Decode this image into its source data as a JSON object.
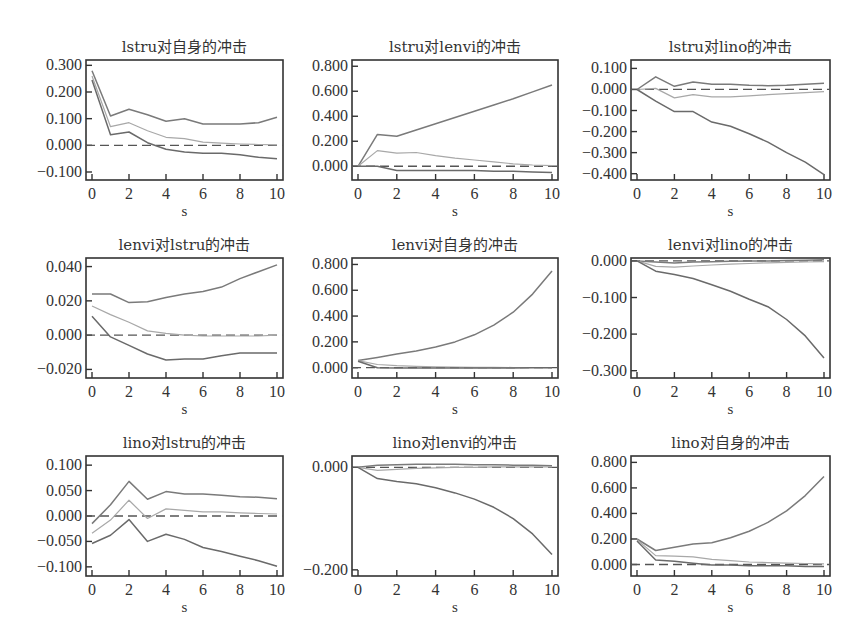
{
  "chart_data": [
    {
      "type": "line",
      "title": "lstru对自身的冲击",
      "xlabel": "s",
      "ylabel": "",
      "x": [
        0,
        1,
        2,
        3,
        4,
        5,
        6,
        7,
        8,
        9,
        10
      ],
      "xticks": [
        0,
        2,
        4,
        6,
        8,
        10
      ],
      "yticks": [
        -0.1,
        0,
        0.1,
        0.2,
        0.3
      ],
      "ytick_labels": [
        "−0.100",
        "0.000",
        "0.100",
        "0.200",
        "0.300"
      ],
      "ylim": [
        -0.13,
        0.32
      ],
      "frame": {
        "x": 86,
        "y": 60,
        "w": 197,
        "h": 120
      },
      "series": [
        {
          "name": "upper",
          "values": [
            0.28,
            0.11,
            0.135,
            0.115,
            0.09,
            0.1,
            0.08,
            0.08,
            0.08,
            0.085,
            0.105
          ]
        },
        {
          "name": "irf",
          "values": [
            0.26,
            0.07,
            0.085,
            0.055,
            0.03,
            0.025,
            0.012,
            0.008,
            0.005,
            0.003,
            0.002
          ]
        },
        {
          "name": "lower",
          "values": [
            0.245,
            0.04,
            0.05,
            0.01,
            -0.015,
            -0.025,
            -0.03,
            -0.03,
            -0.035,
            -0.045,
            -0.05
          ]
        }
      ],
      "zero_line": true,
      "grid": false
    },
    {
      "type": "line",
      "title": "lstru对lenvi的冲击",
      "xlabel": "s",
      "ylabel": "",
      "x": [
        0,
        1,
        2,
        3,
        4,
        5,
        6,
        7,
        8,
        9,
        10
      ],
      "xticks": [
        0,
        2,
        4,
        6,
        8,
        10
      ],
      "yticks": [
        0,
        0.2,
        0.4,
        0.6,
        0.8
      ],
      "ytick_labels": [
        "0.000",
        "0.200",
        "0.400",
        "0.600",
        "0.800"
      ],
      "ylim": [
        -0.11,
        0.85
      ],
      "frame": {
        "x": 352,
        "y": 60,
        "w": 206,
        "h": 120
      },
      "series": [
        {
          "name": "upper",
          "values": [
            0.0,
            0.255,
            0.24,
            0.29,
            0.34,
            0.39,
            0.44,
            0.49,
            0.54,
            0.595,
            0.65
          ]
        },
        {
          "name": "irf",
          "values": [
            0.0,
            0.125,
            0.105,
            0.11,
            0.085,
            0.065,
            0.05,
            0.035,
            0.02,
            0.01,
            0.005
          ]
        },
        {
          "name": "lower",
          "values": [
            0.0,
            0.0,
            -0.035,
            -0.035,
            -0.035,
            -0.035,
            -0.035,
            -0.04,
            -0.04,
            -0.045,
            -0.05
          ]
        }
      ],
      "zero_line": true,
      "grid": false
    },
    {
      "type": "line",
      "title": "lstru对lino的冲击",
      "xlabel": "s",
      "ylabel": "",
      "x": [
        0,
        1,
        2,
        3,
        4,
        5,
        6,
        7,
        8,
        9,
        10
      ],
      "xticks": [
        0,
        2,
        4,
        6,
        8,
        10
      ],
      "yticks": [
        -0.4,
        -0.3,
        -0.2,
        -0.1,
        0,
        0.1
      ],
      "ytick_labels": [
        "−0.400",
        "−0.300",
        "−0.200",
        "−0.100",
        "0.000",
        "0.100"
      ],
      "ylim": [
        -0.43,
        0.14
      ],
      "frame": {
        "x": 631,
        "y": 60,
        "w": 199,
        "h": 120
      },
      "series": [
        {
          "name": "upper",
          "values": [
            0.0,
            0.06,
            0.015,
            0.035,
            0.025,
            0.025,
            0.02,
            0.018,
            0.02,
            0.025,
            0.03
          ]
        },
        {
          "name": "irf",
          "values": [
            0.0,
            0.005,
            -0.04,
            -0.025,
            -0.035,
            -0.035,
            -0.03,
            -0.025,
            -0.02,
            -0.015,
            -0.01
          ]
        },
        {
          "name": "lower",
          "values": [
            0.0,
            -0.055,
            -0.105,
            -0.105,
            -0.155,
            -0.175,
            -0.21,
            -0.25,
            -0.3,
            -0.345,
            -0.405
          ]
        }
      ],
      "zero_line": true,
      "grid": false
    },
    {
      "type": "line",
      "title": "lenvi对lstru的冲击",
      "xlabel": "s",
      "ylabel": "",
      "x": [
        0,
        1,
        2,
        3,
        4,
        5,
        6,
        7,
        8,
        9,
        10
      ],
      "xticks": [
        0,
        2,
        4,
        6,
        8,
        10
      ],
      "yticks": [
        -0.02,
        0,
        0.02,
        0.04
      ],
      "ytick_labels": [
        "−0.020",
        "0.000",
        "0.020",
        "0.040"
      ],
      "ylim": [
        -0.025,
        0.045
      ],
      "frame": {
        "x": 86,
        "y": 258,
        "w": 197,
        "h": 120
      },
      "series": [
        {
          "name": "upper",
          "values": [
            0.024,
            0.024,
            0.019,
            0.0195,
            0.022,
            0.024,
            0.0255,
            0.028,
            0.033,
            0.037,
            0.041
          ]
        },
        {
          "name": "irf",
          "values": [
            0.017,
            0.012,
            0.0075,
            0.0025,
            0.001,
            0.0,
            -0.0005,
            -0.0005,
            -0.0005,
            -0.0005,
            0.0
          ]
        },
        {
          "name": "lower",
          "values": [
            0.011,
            -0.001,
            -0.006,
            -0.011,
            -0.0145,
            -0.014,
            -0.014,
            -0.012,
            -0.0105,
            -0.0105,
            -0.0105
          ]
        }
      ],
      "zero_line": true,
      "grid": false
    },
    {
      "type": "line",
      "title": "lenvi对自身的冲击",
      "xlabel": "s",
      "ylabel": "",
      "x": [
        0,
        1,
        2,
        3,
        4,
        5,
        6,
        7,
        8,
        9,
        10
      ],
      "xticks": [
        0,
        2,
        4,
        6,
        8,
        10
      ],
      "yticks": [
        0,
        0.2,
        0.4,
        0.6,
        0.8
      ],
      "ytick_labels": [
        "0.000",
        "0.200",
        "0.400",
        "0.600",
        "0.800"
      ],
      "ylim": [
        -0.08,
        0.85
      ],
      "frame": {
        "x": 352,
        "y": 258,
        "w": 206,
        "h": 120
      },
      "series": [
        {
          "name": "upper",
          "values": [
            0.055,
            0.08,
            0.105,
            0.13,
            0.16,
            0.2,
            0.255,
            0.33,
            0.43,
            0.57,
            0.75
          ]
        },
        {
          "name": "irf",
          "values": [
            0.055,
            0.025,
            0.015,
            0.01,
            0.007,
            0.005,
            0.003,
            0.002,
            0.001,
            0.001,
            0.0
          ]
        },
        {
          "name": "lower",
          "values": [
            0.05,
            0.0,
            -0.002,
            -0.003,
            -0.003,
            -0.003,
            -0.003,
            -0.002,
            -0.002,
            -0.001,
            -0.001
          ]
        }
      ],
      "zero_line": true,
      "grid": false
    },
    {
      "type": "line",
      "title": "lenvi对lino的冲击",
      "xlabel": "s",
      "ylabel": "",
      "x": [
        0,
        1,
        2,
        3,
        4,
        5,
        6,
        7,
        8,
        9,
        10
      ],
      "xticks": [
        0,
        2,
        4,
        6,
        8,
        10
      ],
      "yticks": [
        -0.3,
        -0.2,
        -0.1,
        0
      ],
      "ytick_labels": [
        "−0.300",
        "−0.200",
        "−0.100",
        "0.000"
      ],
      "ylim": [
        -0.32,
        0.008
      ],
      "frame": {
        "x": 631,
        "y": 258,
        "w": 199,
        "h": 120
      },
      "series": [
        {
          "name": "upper",
          "values": [
            0.0,
            -0.003,
            -0.006,
            -0.003,
            -0.002,
            -0.001,
            0.0,
            0.0,
            0.001,
            0.002,
            0.003
          ]
        },
        {
          "name": "irf",
          "values": [
            0.0,
            -0.015,
            -0.017,
            -0.014,
            -0.011,
            -0.009,
            -0.007,
            -0.005,
            -0.004,
            -0.003,
            -0.002
          ]
        },
        {
          "name": "lower",
          "values": [
            0.0,
            -0.028,
            -0.037,
            -0.048,
            -0.065,
            -0.083,
            -0.105,
            -0.125,
            -0.16,
            -0.205,
            -0.265
          ]
        }
      ],
      "zero_line": true,
      "grid": false
    },
    {
      "type": "line",
      "title": "lino对lstru的冲击",
      "xlabel": "s",
      "ylabel": "",
      "x": [
        0,
        1,
        2,
        3,
        4,
        5,
        6,
        7,
        8,
        9,
        10
      ],
      "xticks": [
        0,
        2,
        4,
        6,
        8,
        10
      ],
      "yticks": [
        -0.1,
        -0.05,
        0,
        0.05,
        0.1
      ],
      "ytick_labels": [
        "−0.100",
        "−0.050",
        "0.000",
        "0.050",
        "0.100"
      ],
      "ylim": [
        -0.118,
        0.118
      ],
      "frame": {
        "x": 86,
        "y": 456,
        "w": 197,
        "h": 120
      },
      "series": [
        {
          "name": "upper",
          "values": [
            -0.015,
            0.022,
            0.068,
            0.033,
            0.048,
            0.043,
            0.043,
            0.041,
            0.038,
            0.037,
            0.034
          ]
        },
        {
          "name": "irf",
          "values": [
            -0.034,
            -0.008,
            0.031,
            -0.005,
            0.014,
            0.011,
            0.008,
            0.008,
            0.006,
            0.005,
            0.004
          ]
        },
        {
          "name": "lower",
          "values": [
            -0.054,
            -0.038,
            -0.007,
            -0.05,
            -0.036,
            -0.046,
            -0.062,
            -0.07,
            -0.079,
            -0.088,
            -0.099
          ]
        }
      ],
      "zero_line": true,
      "grid": false
    },
    {
      "type": "line",
      "title": "lino对lenvi的冲击",
      "xlabel": "s",
      "ylabel": "",
      "x": [
        0,
        1,
        2,
        3,
        4,
        5,
        6,
        7,
        8,
        9,
        10
      ],
      "xticks": [
        0,
        2,
        4,
        6,
        8,
        10
      ],
      "yticks": [
        -0.2,
        0
      ],
      "ytick_labels": [
        "−0.200",
        "0.000"
      ],
      "ylim": [
        -0.212,
        0.022
      ],
      "frame": {
        "x": 352,
        "y": 456,
        "w": 206,
        "h": 120
      },
      "series": [
        {
          "name": "upper",
          "values": [
            0.0,
            0.004,
            0.005,
            0.006,
            0.006,
            0.006,
            0.005,
            0.005,
            0.004,
            0.004,
            0.003
          ]
        },
        {
          "name": "irf",
          "values": [
            0.0,
            -0.006,
            -0.004,
            -0.002,
            -0.001,
            0.0,
            0.0,
            0.001,
            0.001,
            0.001,
            0.001
          ]
        },
        {
          "name": "lower",
          "values": [
            0.0,
            -0.022,
            -0.028,
            -0.032,
            -0.04,
            -0.05,
            -0.062,
            -0.078,
            -0.1,
            -0.13,
            -0.17
          ]
        }
      ],
      "zero_line": true,
      "grid": false
    },
    {
      "type": "line",
      "title": "lino对自身的冲击",
      "xlabel": "s",
      "ylabel": "",
      "x": [
        0,
        1,
        2,
        3,
        4,
        5,
        6,
        7,
        8,
        9,
        10
      ],
      "xticks": [
        0,
        2,
        4,
        6,
        8,
        10
      ],
      "yticks": [
        0,
        0.2,
        0.4,
        0.6,
        0.8
      ],
      "ytick_labels": [
        "0.000",
        "0.200",
        "0.400",
        "0.600",
        "0.800"
      ],
      "ylim": [
        -0.09,
        0.85
      ],
      "frame": {
        "x": 631,
        "y": 456,
        "w": 199,
        "h": 120
      },
      "series": [
        {
          "name": "upper",
          "values": [
            0.2,
            0.11,
            0.135,
            0.16,
            0.17,
            0.21,
            0.26,
            0.33,
            0.42,
            0.54,
            0.69
          ]
        },
        {
          "name": "irf",
          "values": [
            0.195,
            0.07,
            0.065,
            0.06,
            0.04,
            0.03,
            0.02,
            0.015,
            0.01,
            0.008,
            0.005
          ]
        },
        {
          "name": "lower",
          "values": [
            0.185,
            0.035,
            0.025,
            0.01,
            -0.005,
            -0.005,
            -0.01,
            -0.01,
            -0.01,
            -0.015,
            -0.015
          ]
        }
      ],
      "zero_line": true,
      "grid": false
    }
  ],
  "style": {
    "frame_color": "#333333",
    "upper_color": "#7a7a7a",
    "irf_color": "#a8a8a8",
    "lower_color": "#6a6a6a",
    "zero_line_color": "#555555"
  }
}
